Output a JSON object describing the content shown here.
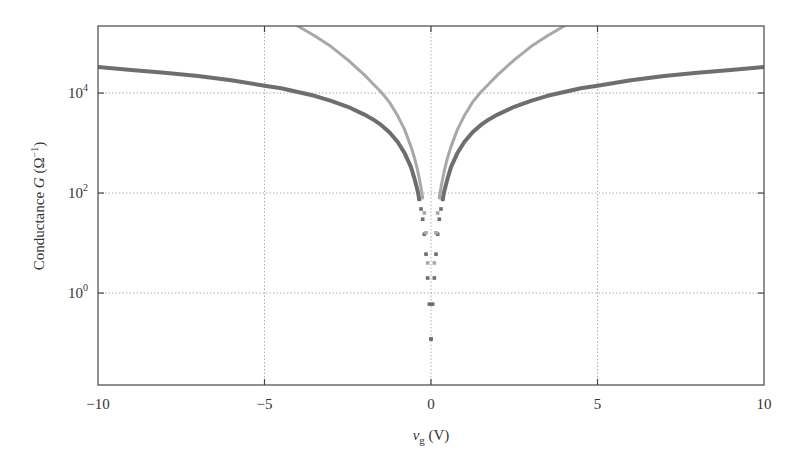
{
  "chart_data": {
    "type": "scatter",
    "title": "",
    "xlabel": "v_g (V)",
    "xlabel_main": "v",
    "xlabel_sub": "g",
    "xlabel_unit": " (V)",
    "ylabel": "Conductance G (Ω⁻¹)",
    "ylabel_main": "Conductance ",
    "ylabel_var": "G",
    "ylabel_unit_open": " (Ω",
    "ylabel_unit_sup": "−1",
    "ylabel_unit_close": ")",
    "yscale": "log",
    "xlim": [
      -10,
      10
    ],
    "ylim": [
      0.0145,
      219000
    ],
    "grid": true,
    "legend": null,
    "x_ticks": [
      {
        "value": -10,
        "label": "−10"
      },
      {
        "value": -5,
        "label": "−5"
      },
      {
        "value": 0,
        "label": "0"
      },
      {
        "value": 5,
        "label": "5"
      },
      {
        "value": 10,
        "label": "10"
      }
    ],
    "y_ticks": [
      {
        "value": 1,
        "base": "10",
        "exp": "0"
      },
      {
        "value": 100,
        "base": "10",
        "exp": "2"
      },
      {
        "value": 10000,
        "base": "10",
        "exp": "4"
      }
    ],
    "series": [
      {
        "name": "dark-series",
        "color": "#6e6e6e",
        "x": [
          -10,
          -9,
          -8,
          -7,
          -6,
          -5,
          -4.5,
          -4,
          -3.5,
          -3,
          -2.5,
          -2,
          -1.75,
          -1.5,
          -1.25,
          -1,
          -0.8,
          -0.6,
          -0.5,
          -0.4,
          -0.35,
          -0.3,
          -0.25,
          -0.2,
          -0.15,
          -0.1,
          -0.05,
          0,
          0.05,
          0.1,
          0.15,
          0.2,
          0.25,
          0.3,
          0.35,
          0.4,
          0.5,
          0.6,
          0.8,
          1,
          1.25,
          1.5,
          1.75,
          2,
          2.5,
          3,
          3.5,
          4,
          4.5,
          5,
          6,
          7,
          8,
          9,
          10
        ],
        "y": [
          33000,
          29000,
          25500,
          22000,
          18000,
          14000,
          12500,
          10500,
          8800,
          7000,
          5300,
          3700,
          3000,
          2300,
          1650,
          1050,
          640,
          330,
          200,
          110,
          75,
          48,
          30,
          15,
          6,
          2,
          0.6,
          0.12,
          0.6,
          2,
          6,
          15,
          30,
          48,
          75,
          110,
          200,
          330,
          640,
          1050,
          1650,
          2300,
          3000,
          3700,
          5300,
          7000,
          8800,
          10500,
          12500,
          14000,
          18000,
          22000,
          25500,
          29000,
          33000
        ]
      },
      {
        "name": "light-series",
        "color": "#a8a8a8",
        "x": [
          -4,
          -3.5,
          -3,
          -2.5,
          -2,
          -1.75,
          -1.5,
          -1.25,
          -1,
          -0.8,
          -0.6,
          -0.5,
          -0.4,
          -0.3,
          -0.25,
          -0.2,
          -0.15,
          -0.1,
          0.1,
          0.15,
          0.2,
          0.25,
          0.3,
          0.4,
          0.5,
          0.6,
          0.8,
          1,
          1.25,
          1.5,
          1.75,
          2,
          2.5,
          3,
          3.5,
          4
        ],
        "y": [
          219000,
          140000,
          85000,
          46000,
          23000,
          15500,
          10500,
          6600,
          3500,
          1900,
          850,
          520,
          280,
          130,
          80,
          40,
          16,
          4,
          4,
          16,
          40,
          80,
          130,
          280,
          520,
          850,
          1900,
          3500,
          6600,
          10500,
          15500,
          23000,
          46000,
          85000,
          140000,
          219000
        ]
      }
    ],
    "annotations": []
  },
  "layout": {
    "plot_left": 98,
    "plot_top": 26,
    "plot_right": 764,
    "plot_bottom": 385
  }
}
